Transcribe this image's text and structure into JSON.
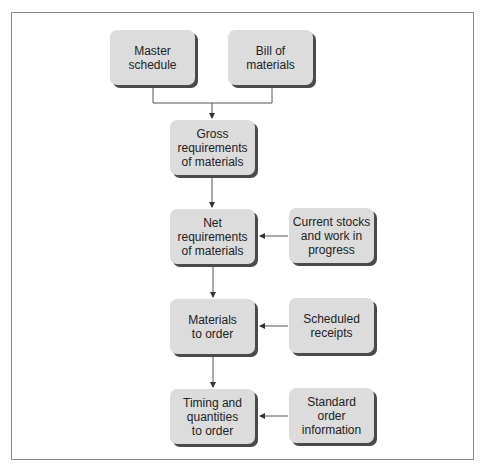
{
  "diagram": {
    "type": "flowchart",
    "nodes": {
      "master_schedule": "Master\nschedule",
      "bill_of_materials": "Bill of\nmaterials",
      "gross_requirements": "Gross\nrequirements\nof materials",
      "net_requirements": "Net\nrequirements\nof materials",
      "current_stocks": "Current stocks\nand work in\nprogress",
      "materials_to_order": "Materials\nto order",
      "scheduled_receipts": "Scheduled\nreceipts",
      "timing_quantities": "Timing and\nquantities\nto order",
      "standard_order_info": "Standard order\ninformation"
    },
    "edges": [
      {
        "from": "master_schedule",
        "to": "gross_requirements"
      },
      {
        "from": "bill_of_materials",
        "to": "gross_requirements"
      },
      {
        "from": "gross_requirements",
        "to": "net_requirements"
      },
      {
        "from": "current_stocks",
        "to": "net_requirements"
      },
      {
        "from": "net_requirements",
        "to": "materials_to_order"
      },
      {
        "from": "scheduled_receipts",
        "to": "materials_to_order"
      },
      {
        "from": "materials_to_order",
        "to": "timing_quantities"
      },
      {
        "from": "standard_order_info",
        "to": "timing_quantities"
      }
    ],
    "colors": {
      "box_fill": "#dcdcdc",
      "box_shadow": "#4a4a4a",
      "line": "#555555",
      "frame": "#8a8a8a"
    }
  }
}
